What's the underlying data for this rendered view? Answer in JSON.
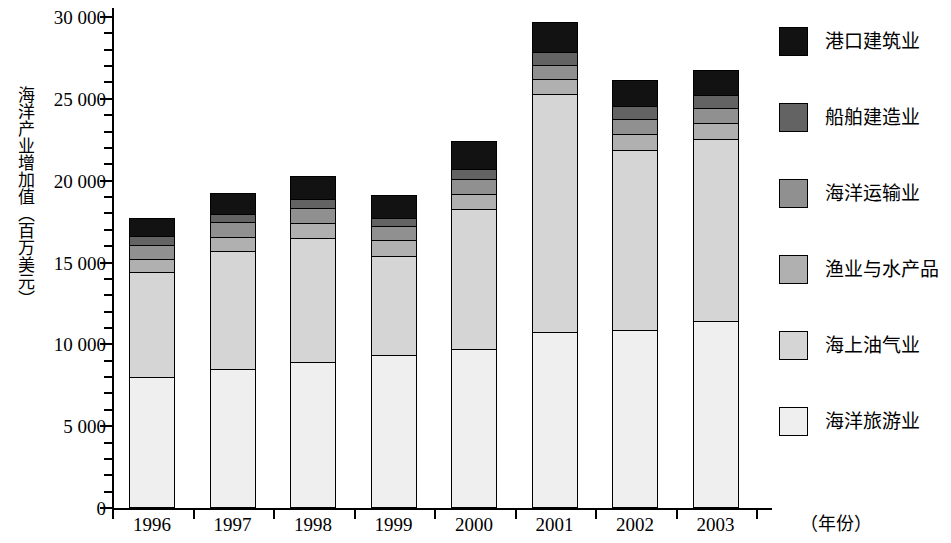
{
  "chart_data": {
    "type": "bar",
    "subtype": "stacked",
    "title": "",
    "xlabel": "（年份）",
    "ylabel": "海洋产业增加值（百万美元）",
    "ylim": [
      0,
      30000
    ],
    "ytick_labels": [
      "0",
      "5 000",
      "10 000",
      "15 000",
      "20 000",
      "25 000",
      "30 000"
    ],
    "ytick_values": [
      0,
      5000,
      10000,
      15000,
      20000,
      25000,
      30000
    ],
    "yminor_step": 1000,
    "grid": false,
    "legend_position": "right",
    "categories": [
      "1996",
      "1997",
      "1998",
      "1999",
      "2000",
      "2001",
      "2002",
      "2003"
    ],
    "series": [
      {
        "name": "海洋旅游业",
        "color": "#efefef",
        "values": [
          8000,
          8500,
          8900,
          9350,
          9700,
          10750,
          10850,
          11400
        ]
      },
      {
        "name": "海上油气业",
        "color": "#d5d5d5",
        "values": [
          6400,
          7200,
          7600,
          6050,
          8600,
          14550,
          11050,
          11150
        ]
      },
      {
        "name": "渔业与水产品",
        "color": "#b0b0b0",
        "values": [
          800,
          850,
          900,
          950,
          900,
          900,
          950,
          1000
        ]
      },
      {
        "name": "海洋运输业",
        "color": "#909090",
        "values": [
          900,
          900,
          950,
          900,
          900,
          900,
          900,
          900
        ]
      },
      {
        "name": "船舶建造业",
        "color": "#636363",
        "values": [
          500,
          500,
          550,
          500,
          600,
          750,
          800,
          800
        ]
      },
      {
        "name": "港口建筑业",
        "color": "#121212",
        "values": [
          1100,
          1300,
          1400,
          1400,
          1700,
          1850,
          1600,
          1500
        ]
      }
    ],
    "totals": [
      17700,
      19250,
      20300,
      19150,
      22400,
      29700,
      26150,
      26750
    ]
  },
  "legend": {
    "items": [
      {
        "label": "港口建筑业",
        "color": "#121212"
      },
      {
        "label": "船舶建造业",
        "color": "#636363"
      },
      {
        "label": "海洋运输业",
        "color": "#909090"
      },
      {
        "label": "渔业与水产品",
        "color": "#b0b0b0"
      },
      {
        "label": "海上油气业",
        "color": "#d5d5d5"
      },
      {
        "label": "海洋旅游业",
        "color": "#efefef"
      }
    ]
  }
}
